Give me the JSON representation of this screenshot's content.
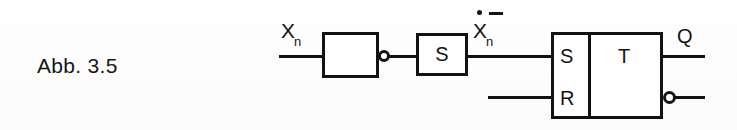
{
  "figure": {
    "caption": "Abb. 3.5",
    "background_color": "#fefefe",
    "ink_color": "#121212"
  },
  "diagram": {
    "type": "logic-block-diagram",
    "input_signal": {
      "base": "X",
      "subscript": "n",
      "full": "Xn"
    },
    "intermediate_signal": {
      "base": "X",
      "subscript": "n",
      "accent_dot": true,
      "accent_bar": true,
      "full": "Xn (dotted, negated)"
    },
    "blocks": [
      {
        "id": "inverter",
        "label": "",
        "has_output_bubble": true
      },
      {
        "id": "delay",
        "label": "S",
        "has_output_bubble": false
      },
      {
        "id": "flipflop",
        "label": "T",
        "input_s_label": "S",
        "input_r_label": "R",
        "has_output_bubble": true
      }
    ],
    "outputs": [
      {
        "id": "q",
        "label": "Q",
        "inverted": false
      },
      {
        "id": "q-not",
        "label": "",
        "inverted": true
      }
    ]
  }
}
